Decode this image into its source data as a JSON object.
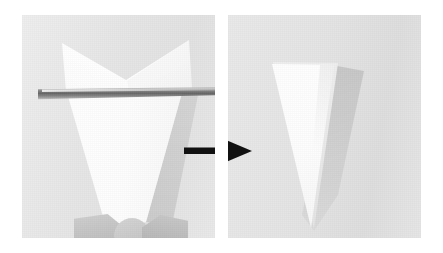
{
  "figure": {
    "title": "Paper folding step: trimming a folded sheet into a triangle",
    "type": "photo-sequence",
    "panel_count": 2,
    "width": 443,
    "height": 253,
    "background_color": "#ffffff"
  },
  "panels": [
    {
      "id": "before",
      "label": "Folded paper being cut",
      "alt": "A white folded sheet of paper held upright, with a blade cutting horizontally across it just below the V-shaped upper flaps",
      "backdrop_color": "#e6e6e6",
      "paper_color": "#ffffff",
      "objects": [
        {
          "name": "upper-flaps",
          "description": "two wing-like paper flaps forming a V notch at the top"
        },
        {
          "name": "blade",
          "description": "metal blade cutting horizontally across the paper",
          "color": "#5a5a5a"
        },
        {
          "name": "lower-cone",
          "description": "white tapering cone of paper below the blade"
        },
        {
          "name": "fingers",
          "description": "fingers holding the paper at the bottom",
          "color": "#c6c6c6"
        }
      ]
    },
    {
      "id": "after",
      "label": "Resulting triangle",
      "alt": "A clean white downward-pointing triangle of folded paper standing on a grey backdrop with a soft shadow to its right",
      "backdrop_color": "#e2e2e2",
      "paper_color": "#ffffff",
      "objects": [
        {
          "name": "triangle",
          "description": "downward pointing white paper triangle"
        },
        {
          "name": "fold-sliver",
          "description": "thin folded-under layer along the right edge",
          "color": "#e9e9e9"
        },
        {
          "name": "cast-shadow",
          "description": "soft grey shadow cast to the lower right",
          "color": "#b9b9b9"
        }
      ]
    }
  ],
  "arrow": {
    "name": "process-arrow",
    "direction": "right",
    "color": "#111111",
    "meaning": "transforms into"
  }
}
